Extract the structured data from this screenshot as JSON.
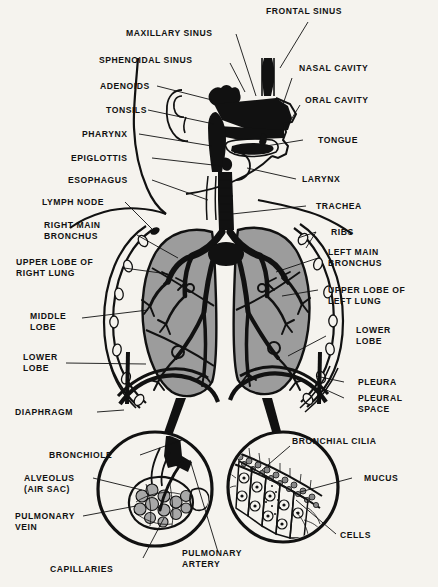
{
  "diagram": {
    "background_color": "#f5f3ee",
    "ink_color": "#111111",
    "lung_fill_color": "#9c9c9c"
  },
  "labels": {
    "frontal_sinus": "FRONTAL SINUS",
    "maxillary_sinus": "MAXILLARY SINUS",
    "sphenoidal_sinus": "SPHENOIDAL SINUS",
    "adenoids": "ADENOIDS",
    "tonsils": "TONSILS",
    "pharynx": "PHARYNX",
    "epiglottis": "EPIGLOTTIS",
    "esophagus": "ESOPHAGUS",
    "lymph_node": "LYMPH NODE",
    "right_main_bronchus_l1": "RIGHT MAIN",
    "right_main_bronchus_l2": "BRONCHUS",
    "upper_lobe_right_l1": "UPPER LOBE OF",
    "upper_lobe_right_l2": "RIGHT LUNG",
    "middle_lobe_l1": "MIDDLE",
    "middle_lobe_l2": "LOBE",
    "lower_lobe_left_l1": "LOWER",
    "lower_lobe_left_l2": "LOBE",
    "diaphragm": "DIAPHRAGM",
    "nasal_cavity": "NASAL CAVITY",
    "oral_cavity": "ORAL CAVITY",
    "tongue": "TONGUE",
    "larynx": "LARYNX",
    "trachea": "TRACHEA",
    "ribs": "RIBS",
    "left_main_bronchus_l1": "LEFT MAIN",
    "left_main_bronchus_l2": "BRONCHUS",
    "upper_lobe_left_l1": "UPPER LOBE OF",
    "upper_lobe_left_l2": "LEFT LUNG",
    "lower_lobe_right_l1": "LOWER",
    "lower_lobe_right_l2": "LOBE",
    "pleura": "PLEURA",
    "pleural_space_l1": "PLEURAL",
    "pleural_space_l2": "SPACE",
    "bronchiole": "BRONCHIOLE",
    "alveolus_l1": "ALVEOLUS",
    "alveolus_l2": "(AIR SAC)",
    "pulmonary_vein_l1": "PULMONARY",
    "pulmonary_vein_l2": "VEIN",
    "capillaries": "CAPILLARIES",
    "pulmonary_artery_l1": "PULMONARY",
    "pulmonary_artery_l2": "ARTERY",
    "bronchial_cilia": "BRONCHIAL CILIA",
    "mucus": "MUCUS",
    "cells": "CELLS"
  }
}
